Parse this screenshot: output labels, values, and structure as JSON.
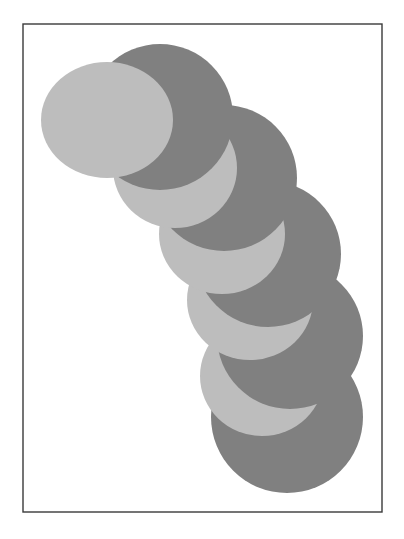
{
  "figure": {
    "width": 404,
    "height": 539,
    "background": "#ffffff",
    "frame": {
      "x": 23,
      "y": 24,
      "width": 359,
      "height": 488,
      "stroke": "#3a3a3a",
      "stroke_width": 1.4
    },
    "colors": {
      "dark": "#808080",
      "light": "#bdbdbd"
    },
    "pairs": [
      {
        "dark": {
          "cx": 287,
          "cy": 417,
          "r": 76
        },
        "light": {
          "cx": 262,
          "cy": 376,
          "rx": 62,
          "ry": 60
        }
      },
      {
        "dark": {
          "cx": 290,
          "cy": 336,
          "r": 73
        },
        "light": {
          "cx": 250,
          "cy": 300,
          "rx": 63,
          "ry": 60
        }
      },
      {
        "dark": {
          "cx": 268,
          "cy": 254,
          "r": 73
        },
        "light": {
          "cx": 222,
          "cy": 234,
          "rx": 63,
          "ry": 60
        }
      },
      {
        "dark": {
          "cx": 224,
          "cy": 178,
          "r": 73
        },
        "light": {
          "cx": 175,
          "cy": 168,
          "rx": 62,
          "ry": 60
        }
      },
      {
        "dark": {
          "cx": 160,
          "cy": 117,
          "r": 73
        },
        "light": {
          "cx": 107,
          "cy": 120,
          "rx": 66,
          "ry": 58
        }
      }
    ]
  }
}
